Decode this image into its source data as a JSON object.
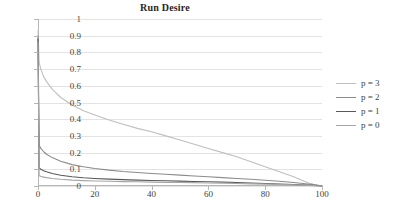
{
  "chart_data": {
    "type": "line",
    "title": "Run Desire",
    "xlabel": "",
    "ylabel": "",
    "xlim": [
      0,
      100
    ],
    "ylim": [
      0,
      1
    ],
    "grid": "horizontal",
    "legend_position": "right",
    "x_ticks": [
      "0",
      "20",
      "40",
      "60",
      "80",
      "100"
    ],
    "x_tick_values": [
      0,
      20,
      40,
      60,
      80,
      100
    ],
    "y_ticks": [
      "0",
      "0.1",
      "0.2",
      "0.3",
      "0.4",
      "0.5",
      "0.6",
      "0.7",
      "0.8",
      "0.9",
      "1"
    ],
    "y_tick_values": [
      0,
      0.1,
      0.2,
      0.3,
      0.4,
      0.5,
      0.6,
      0.7,
      0.8,
      0.9,
      1
    ],
    "series": [
      {
        "name": "p = 3",
        "color": "#bfbfbf",
        "x": [
          0,
          0.4,
          1,
          2,
          3,
          5,
          8,
          12,
          16,
          20,
          25,
          30,
          35,
          40,
          45,
          50,
          55,
          60,
          65,
          70,
          75,
          80,
          85,
          90,
          95,
          97,
          100
        ],
        "values": [
          0.93,
          0.74,
          0.7,
          0.655,
          0.625,
          0.58,
          0.53,
          0.485,
          0.45,
          0.425,
          0.395,
          0.37,
          0.345,
          0.325,
          0.3,
          0.275,
          0.25,
          0.225,
          0.2,
          0.175,
          0.145,
          0.115,
          0.085,
          0.055,
          0.02,
          0.01,
          0.0
        ]
      },
      {
        "name": "p = 2",
        "color": "#8c8c8c",
        "x": [
          0,
          0.4,
          1,
          2,
          3,
          5,
          8,
          12,
          16,
          20,
          25,
          30,
          35,
          40,
          45,
          50,
          55,
          60,
          65,
          70,
          75,
          80,
          85,
          90,
          95,
          97,
          100
        ],
        "values": [
          0.9,
          0.245,
          0.225,
          0.205,
          0.19,
          0.17,
          0.148,
          0.128,
          0.115,
          0.105,
          0.095,
          0.087,
          0.081,
          0.075,
          0.07,
          0.065,
          0.06,
          0.055,
          0.05,
          0.045,
          0.04,
          0.034,
          0.028,
          0.021,
          0.012,
          0.008,
          0.0
        ]
      },
      {
        "name": "p = 1",
        "color": "#595959",
        "x": [
          0,
          0.4,
          1,
          2,
          3,
          5,
          8,
          12,
          16,
          20,
          25,
          30,
          35,
          40,
          45,
          50,
          55,
          60,
          65,
          70,
          75,
          80,
          85,
          90,
          95,
          97,
          100
        ],
        "values": [
          0.88,
          0.108,
          0.1,
          0.092,
          0.085,
          0.075,
          0.064,
          0.055,
          0.049,
          0.045,
          0.041,
          0.038,
          0.035,
          0.033,
          0.031,
          0.029,
          0.027,
          0.025,
          0.023,
          0.021,
          0.018,
          0.015,
          0.012,
          0.009,
          0.005,
          0.003,
          0.0
        ]
      },
      {
        "name": "p = 0",
        "color": "#a6a6a6",
        "x": [
          0,
          0.4,
          1,
          2,
          3,
          5,
          8,
          12,
          16,
          20,
          25,
          30,
          35,
          40,
          45,
          50,
          55,
          60,
          65,
          70,
          75,
          80,
          85,
          90,
          95,
          97,
          100
        ],
        "values": [
          0.86,
          0.062,
          0.058,
          0.053,
          0.05,
          0.045,
          0.04,
          0.035,
          0.032,
          0.03,
          0.028,
          0.026,
          0.025,
          0.023,
          0.022,
          0.021,
          0.02,
          0.018,
          0.017,
          0.015,
          0.013,
          0.011,
          0.009,
          0.007,
          0.004,
          0.002,
          0.0
        ]
      }
    ]
  },
  "legend": {
    "items": [
      {
        "label": "p = 3"
      },
      {
        "label": "p = 2"
      },
      {
        "label": "p = 1"
      },
      {
        "label": "p = 0"
      }
    ]
  },
  "colors": {
    "gridline": "#e3e3e3",
    "axis": "#b6b6b6",
    "text": "#3f3f3f",
    "title": "#262626",
    "background": "#ffffff"
  }
}
